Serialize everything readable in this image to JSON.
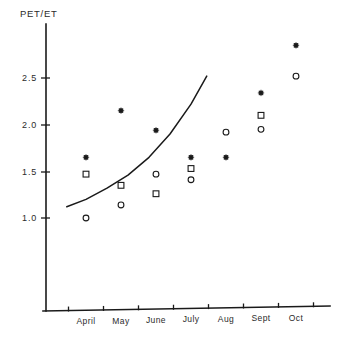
{
  "chart_data": {
    "type": "scatter",
    "title": "PET/ET",
    "ylabel": "PET/ET",
    "xlabel": "",
    "categories": [
      "April",
      "May",
      "June",
      "July",
      "Aug",
      "Sept",
      "Oct"
    ],
    "ylim": [
      0.55,
      2.95
    ],
    "ytick_labels": [
      "2.5",
      "2.0",
      "1.5",
      "1.0"
    ],
    "ytick_values": [
      2.5,
      2.0,
      1.5,
      1.0
    ],
    "grid": false,
    "legend": "none",
    "series": [
      {
        "name": "star",
        "marker": "star",
        "values": [
          1.65,
          2.15,
          1.94,
          1.65,
          1.65,
          2.34,
          2.85
        ]
      },
      {
        "name": "square",
        "marker": "square",
        "values": [
          1.47,
          1.35,
          1.26,
          1.53,
          null,
          2.1,
          null
        ]
      },
      {
        "name": "circle",
        "marker": "circle",
        "values": [
          1.0,
          1.14,
          1.47,
          1.41,
          1.92,
          1.95,
          2.52
        ]
      }
    ],
    "fit_curve": {
      "name": "fitted-trend",
      "x": [
        3.45,
        4.0,
        4.6,
        5.2,
        5.8,
        6.4,
        7.0,
        7.45
      ],
      "values": [
        1.12,
        1.2,
        1.32,
        1.46,
        1.65,
        1.9,
        2.22,
        2.52
      ]
    }
  },
  "axis": {
    "y_title": "PET/ET"
  }
}
